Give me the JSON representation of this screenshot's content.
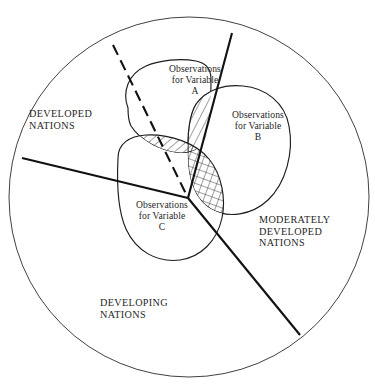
{
  "diagram": {
    "universe": {
      "shape": "circle",
      "center_x": 189,
      "center_y": 197,
      "radius": 180,
      "stroke_color": "#2b2b2b"
    },
    "regions": [
      {
        "id": "developed",
        "label": "DEVELOPED\nNATIONS",
        "line1": "DEVELOPED",
        "line2": "NATIONS"
      },
      {
        "id": "moderately-developed",
        "label": "MODERATELY\nDEVELOPED\nNATIONS",
        "line1": "MODERATELY",
        "line2": "DEVELOPED",
        "line3": "NATIONS"
      },
      {
        "id": "developing",
        "label": "DEVELOPING\nNATIONS",
        "line1": "DEVELOPING",
        "line2": "NATIONS"
      }
    ],
    "observation_sets": [
      {
        "id": "a",
        "label": "Observations\nfor Variable\nA",
        "variable": "A"
      },
      {
        "id": "b",
        "label": "Observations\nfor Variable\nB",
        "variable": "B"
      },
      {
        "id": "c",
        "label": "Observations\nfor Variable\nC",
        "variable": "C"
      }
    ],
    "dividers": [
      {
        "id": "developed-moderately",
        "style": "solid",
        "x1": 232,
        "y1": 33,
        "x2": 188,
        "y2": 198
      },
      {
        "id": "developed-developing",
        "style": "solid",
        "x1": 22,
        "y1": 158,
        "x2": 188,
        "y2": 198
      },
      {
        "id": "moderately-developing",
        "style": "solid",
        "x1": 188,
        "y1": 198,
        "x2": 300,
        "y2": 335
      },
      {
        "id": "sampling-boundary",
        "style": "dashed",
        "x1": 113,
        "y1": 45,
        "x2": 188,
        "y2": 198
      }
    ],
    "overlaps": [
      {
        "id": "a-intersect-b",
        "sets": "A and B",
        "hatching": "diagonal"
      },
      {
        "id": "a-intersect-c",
        "sets": "A and C",
        "hatching": "diagonal"
      },
      {
        "id": "b-intersect-c",
        "sets": "B and C",
        "hatching": "cross"
      }
    ],
    "colors": {
      "ink": "#1a1a1a",
      "outline": "#1d1d1d",
      "divider": "#111111",
      "background": "#ffffff"
    }
  }
}
